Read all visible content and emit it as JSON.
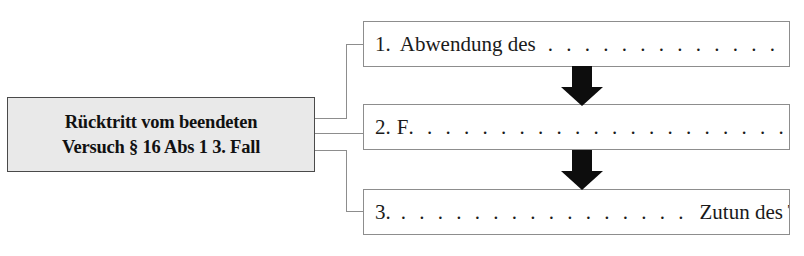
{
  "diagram": {
    "main_box": {
      "line1": "Rücktritt vom beendeten",
      "line2": "Versuch § 16 Abs 1 3. Fall"
    },
    "steps": [
      {
        "number": "1.",
        "text": "Abwendung des",
        "dots": ". . . . . . . . . . . . . . . .",
        "arrow_after": "down-arrow"
      },
      {
        "number": "2.",
        "text": "F",
        "dots": ". . . . . . . . . . . . . . . . . . . . . . . . . . .",
        "arrow_after": "down-arrow"
      },
      {
        "number": "3.",
        "text": "Zutun des Täters",
        "dots": ". . . . . . . . . . . . . . . .",
        "arrow_after": ""
      }
    ],
    "colors": {
      "main_box_fill": "#e9e9e9",
      "main_box_border": "#4a4a4a",
      "step_box_border": "#8d8d8d",
      "connector": "#8d8d8d",
      "arrow": "#0d0d0d",
      "text": "#111111",
      "background": "#ffffff"
    }
  }
}
